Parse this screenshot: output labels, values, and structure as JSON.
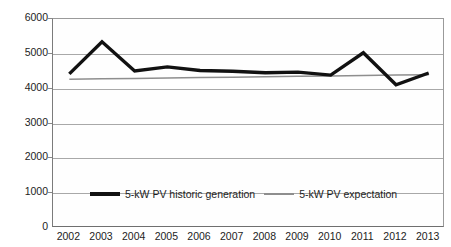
{
  "chart_data": {
    "type": "line",
    "title": "",
    "xlabel": "",
    "ylabel": "Annual generation (kWh)",
    "categories": [
      "2002",
      "2003",
      "2004",
      "2005",
      "2006",
      "2007",
      "2008",
      "2009",
      "2010",
      "2011",
      "2012",
      "2013"
    ],
    "ylim": [
      0,
      6000
    ],
    "ytick_labels": [
      "0",
      "1000",
      "2000",
      "3000",
      "4000",
      "5000",
      "6000"
    ],
    "ytick_values": [
      0,
      1000,
      2000,
      3000,
      4000,
      5000,
      6000
    ],
    "grid": "horizontal",
    "legend_position": "inside-bottom-center",
    "series": [
      {
        "name": "5-kW PV historic generation",
        "color": "#111111",
        "width": 3.4,
        "values": [
          4425,
          5345,
          4510,
          4625,
          4520,
          4500,
          4455,
          4475,
          4390,
          5030,
          4110,
          4450
        ]
      },
      {
        "name": "5-kW PV expectation",
        "color": "#8e8e8e",
        "width": 1.5,
        "values": [
          4270,
          4282,
          4294,
          4306,
          4318,
          4330,
          4342,
          4354,
          4366,
          4378,
          4390,
          4400
        ]
      }
    ]
  },
  "legend": {
    "items": [
      {
        "label": "5-kW PV historic generation"
      },
      {
        "label": "5-kW PV expectation"
      }
    ]
  }
}
